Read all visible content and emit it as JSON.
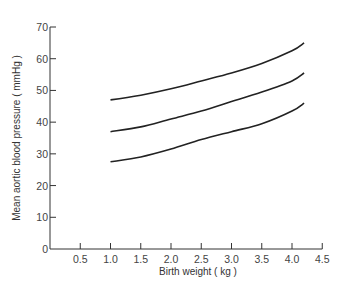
{
  "chart_data": {
    "type": "line",
    "title": "",
    "xlabel": "Birth weight ( kg )",
    "ylabel": "Mean aortic blood pressure ( mmHg )",
    "xlim": [
      0,
      4.5
    ],
    "ylim": [
      0,
      70
    ],
    "x_ticks": [
      0.5,
      1.0,
      1.5,
      2.0,
      2.5,
      3.0,
      3.5,
      4.0,
      4.5
    ],
    "x_tick_labels": [
      "0.5",
      "1.0",
      "1.5",
      "2.0",
      "2.5",
      "3.0",
      "3.5",
      "4.0",
      "4.5"
    ],
    "y_ticks": [
      0,
      10,
      20,
      30,
      40,
      50,
      60,
      70
    ],
    "y_tick_labels": [
      "0",
      "10",
      "20",
      "30",
      "40",
      "50",
      "60",
      "70"
    ],
    "grid": false,
    "legend": null,
    "x": [
      1.0,
      1.5,
      2.0,
      2.5,
      3.0,
      3.5,
      4.0,
      4.2
    ],
    "series": [
      {
        "name": "upper",
        "values": [
          47,
          48.5,
          50.5,
          53,
          55.5,
          58.5,
          62.5,
          65
        ]
      },
      {
        "name": "middle",
        "values": [
          37,
          38.5,
          41,
          43.5,
          46.5,
          49.5,
          53,
          55.5
        ]
      },
      {
        "name": "lower",
        "values": [
          27.5,
          29,
          31.5,
          34.5,
          37,
          39.5,
          43.5,
          46
        ]
      }
    ],
    "colors": {
      "line": "#222222",
      "axis": "#333333"
    }
  }
}
